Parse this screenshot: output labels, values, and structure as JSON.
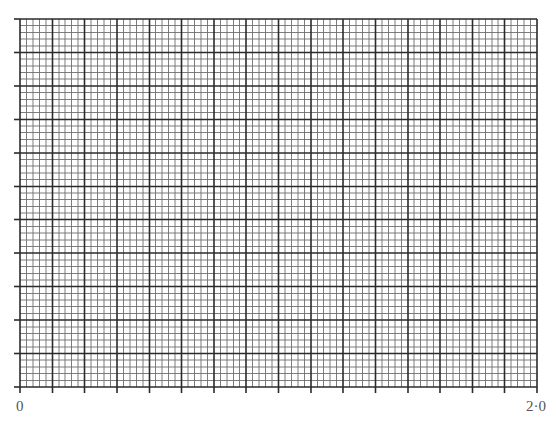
{
  "graph_paper": {
    "origin_px": {
      "x": 20,
      "y": 387
    },
    "width_px": 517,
    "height_px": 368,
    "major_cols": 16,
    "major_rows": 11,
    "minor_per_major": 5,
    "tick_length_px": 6,
    "colors": {
      "background": "#ffffff",
      "major_line": "#2b2b2b",
      "minor_line": "#6e6e6e",
      "label": "#555555"
    }
  },
  "x_axis": {
    "start_label": "0",
    "end_label": "2·0"
  }
}
